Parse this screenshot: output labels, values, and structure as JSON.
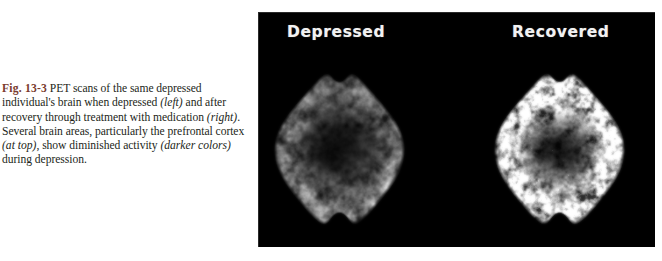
{
  "page": {
    "background_color": "#ffffff",
    "width": 662,
    "height": 261
  },
  "caption": {
    "figure_number": "Fig. 13-3",
    "text_part_1": "  PET scans of the same depressed individual's brain when depressed ",
    "emphasis_1": "(left)",
    "text_part_2": " and after recovery through treatment with medication ",
    "emphasis_2": "(right)",
    "text_part_3": ". Several brain areas, particularly the prefrontal cortex ",
    "emphasis_3": "(at top)",
    "text_part_4": ", show diminished activity ",
    "emphasis_4": "(darker colors)",
    "text_part_5": " during depression.",
    "figure_number_color": "#7a3b2e",
    "text_color": "#231f20",
    "full_text": "Fig. 13-3 PET scans of the same depressed individual's brain when depressed (left) and after recovery through treatment with medication (right). Several brain areas, particularly the prefrontal cortex (at top), show diminished activity (darker colors) during depression."
  },
  "figure_panel": {
    "background_color": "#000000",
    "label_color": "#f2f2f2",
    "scans": [
      {
        "label": "Depressed",
        "condition": "depressed",
        "description": "axial PET brain scan, dim mottled grayscale, reduced prefrontal cortex activity",
        "mean_intensity": 0.42,
        "peak_intensity": 0.78,
        "seed": 1337
      },
      {
        "label": "Recovered",
        "condition": "recovered",
        "description": "axial PET brain scan, bright gyral pattern, restored prefrontal cortex activity",
        "mean_intensity": 0.62,
        "peak_intensity": 1.0,
        "seed": 90210
      }
    ]
  }
}
